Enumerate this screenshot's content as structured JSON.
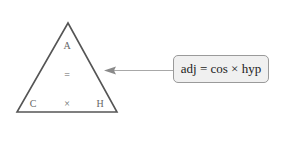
{
  "diagram": {
    "triangle": {
      "top": "A",
      "middle_operator": "=",
      "bottom_left": "C",
      "bottom_middle_operator": "×",
      "bottom_right": "H"
    },
    "callout": {
      "text": "adj = cos × hyp"
    },
    "colors": {
      "triangle_stroke": "#555555",
      "arrow": "#9a9a9a",
      "box_fill": "#f0f0f0",
      "box_border": "#9a9a9a",
      "label_text": "#666666"
    }
  }
}
